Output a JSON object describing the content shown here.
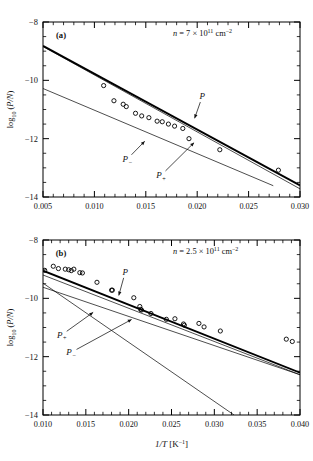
{
  "figure": {
    "title": "",
    "background": "#ffffff",
    "line_color": "#000000",
    "marker_color": "#000000",
    "axis_color": "#000000"
  },
  "panels": [
    {
      "id": "a",
      "panel_label": "(a)",
      "annotation": {
        "prefix_italic": "n",
        "text": "n = 7 × 10",
        "exponent": "11",
        "unit": "cm",
        "unit_exponent": "−2",
        "full": "n = 7 × 10¹¹ cm⁻²"
      },
      "xlabel": "",
      "ylabel": "log10 (P/N)",
      "ylabel_parts": {
        "base": "log",
        "sub": "10",
        "arg": "(P/N)"
      },
      "xlim": [
        0.005,
        0.03
      ],
      "ylim": [
        -14,
        -8
      ],
      "xticks": [
        0.005,
        0.01,
        0.015,
        0.02,
        0.025,
        0.03
      ],
      "xticklabels": [
        "0.005",
        "0.010",
        "0.015",
        "0.020",
        "0.025",
        "0.030"
      ],
      "yticks": [
        -8,
        -10,
        -12,
        -14
      ],
      "yticklabels": [
        "−8",
        "−10",
        "−12",
        "−14"
      ],
      "x_minor_per_interval": 5,
      "y_minor_per_interval": 4,
      "curve_labels": [
        {
          "name": "P",
          "text": "P",
          "x": 0.0205,
          "y": -10.55,
          "arrow_to_x": 0.0197,
          "arrow_to_y": -11.35
        },
        {
          "name": "P_minus",
          "text": "P−",
          "x": 0.0132,
          "y": -12.7,
          "arrow_to_x": 0.015,
          "arrow_to_y": -12.05
        },
        {
          "name": "P_plus",
          "text": "P+",
          "x": 0.0165,
          "y": -13.25,
          "arrow_to_x": 0.0198,
          "arrow_to_y": -12.1
        }
      ]
    },
    {
      "id": "b",
      "panel_label": "(b)",
      "annotation": {
        "prefix_italic": "n",
        "text": "n = 2.5 × 10",
        "exponent": "11",
        "unit": "cm",
        "unit_exponent": "−2",
        "full": "n = 2.5 × 10¹¹ cm⁻²"
      },
      "xlabel": "1/T [K−1]",
      "xlabel_parts": {
        "italic": "1/T",
        "unit": "[K",
        "unit_exp": "−1",
        "unit_end": "]"
      },
      "ylabel": "log10 (P/N)",
      "ylabel_parts": {
        "base": "log",
        "sub": "10",
        "arg": "(P/N)"
      },
      "xlim": [
        0.01,
        0.04
      ],
      "ylim": [
        -14,
        -8
      ],
      "xticks": [
        0.01,
        0.015,
        0.02,
        0.025,
        0.03,
        0.035,
        0.04
      ],
      "xticklabels": [
        "0.010",
        "0.015",
        "0.020",
        "0.025",
        "0.030",
        "0.035",
        "0.040"
      ],
      "yticks": [
        -8,
        -10,
        -12,
        -14
      ],
      "yticklabels": [
        "−8",
        "−10",
        "−12",
        "−14"
      ],
      "x_minor_per_interval": 5,
      "y_minor_per_interval": 4,
      "curve_labels": [
        {
          "name": "P",
          "text": "P",
          "x": 0.0196,
          "y": -9.1,
          "arrow_to_x": 0.0188,
          "arrow_to_y": -9.95
        },
        {
          "name": "P_plus",
          "text": "P+",
          "x": 0.0122,
          "y": -11.25,
          "arrow_to_x": 0.016,
          "arrow_to_y": -10.45
        },
        {
          "name": "P_minus",
          "text": "P−",
          "x": 0.0133,
          "y": -11.85,
          "arrow_to_x": 0.0205,
          "arrow_to_y": -10.7
        }
      ]
    }
  ],
  "chart_data": [
    {
      "panel": "a",
      "type": "scatter",
      "title": "",
      "xlabel": "1/T [K−1]",
      "ylabel": "log10 (P/N)",
      "xlim": [
        0.005,
        0.03
      ],
      "ylim": [
        -14,
        -8
      ],
      "grid": false,
      "legend": "inline-annotations",
      "annotation": "n = 7 × 10¹¹ cm⁻²",
      "series": [
        {
          "name": "data",
          "type": "scatter",
          "marker": "open-circle",
          "x": [
            0.0109,
            0.0119,
            0.0128,
            0.0131,
            0.014,
            0.0146,
            0.0153,
            0.0161,
            0.0166,
            0.0172,
            0.0178,
            0.0186,
            0.0192,
            0.0222,
            0.0279
          ],
          "y": [
            -10.18,
            -10.7,
            -10.82,
            -10.9,
            -11.13,
            -11.22,
            -11.28,
            -11.4,
            -11.42,
            -11.5,
            -11.57,
            -11.65,
            -12.0,
            -12.38,
            -13.08
          ]
        },
        {
          "name": "P",
          "type": "line",
          "style": "solid-thick",
          "x": [
            0.005,
            0.03
          ],
          "y": [
            -8.82,
            -13.6
          ]
        },
        {
          "name": "P_plus",
          "type": "line",
          "style": "solid-thin",
          "x": [
            0.005,
            0.03
          ],
          "y": [
            -8.84,
            -13.72
          ]
        },
        {
          "name": "P_minus",
          "type": "line",
          "style": "solid-thin",
          "x": [
            0.005,
            0.03
          ],
          "y": [
            -10.28,
            -14.0
          ],
          "x_end_clip": 0.0274
        }
      ]
    },
    {
      "panel": "b",
      "type": "scatter",
      "title": "",
      "xlabel": "1/T [K−1]",
      "ylabel": "log10 (P/N)",
      "xlim": [
        0.01,
        0.04
      ],
      "ylim": [
        -14,
        -8
      ],
      "grid": false,
      "legend": "inline-annotations",
      "annotation": "n = 2.5 × 10¹¹ cm⁻²",
      "series": [
        {
          "name": "data",
          "type": "scatter",
          "marker": "open-circle",
          "x": [
            0.0102,
            0.0112,
            0.0118,
            0.0126,
            0.013,
            0.0133,
            0.0136,
            0.0143,
            0.0146,
            0.0163,
            0.018,
            0.0181,
            0.0206,
            0.0213,
            0.0214,
            0.0215,
            0.0226,
            0.0244,
            0.0254,
            0.0264,
            0.0265,
            0.0282,
            0.0288,
            0.0307,
            0.0384,
            0.0391
          ],
          "y": [
            -9.04,
            -8.9,
            -8.98,
            -9.0,
            -9.02,
            -9.05,
            -9.0,
            -9.12,
            -9.13,
            -9.45,
            -9.72,
            -9.72,
            -9.98,
            -10.28,
            -10.38,
            -10.4,
            -10.52,
            -10.72,
            -10.7,
            -10.88,
            -10.92,
            -10.86,
            -10.98,
            -11.12,
            -11.4,
            -11.48
          ]
        },
        {
          "name": "P",
          "type": "line",
          "style": "solid-thick",
          "x": [
            0.01,
            0.04
          ],
          "y": [
            -9.05,
            -12.55
          ]
        },
        {
          "name": "P_plus",
          "type": "line",
          "style": "solid-thin",
          "x": [
            0.01,
            0.04
          ],
          "y": [
            -9.2,
            -12.62
          ]
        },
        {
          "name": "P_minus",
          "type": "line",
          "style": "solid-thin",
          "x": [
            0.01,
            0.0323
          ],
          "y": [
            -9.48,
            -14.0
          ]
        },
        {
          "name": "P_cross",
          "type": "line",
          "style": "solid-thin",
          "x": [
            0.01,
            0.04
          ],
          "y": [
            -9.62,
            -12.62
          ]
        }
      ]
    }
  ]
}
